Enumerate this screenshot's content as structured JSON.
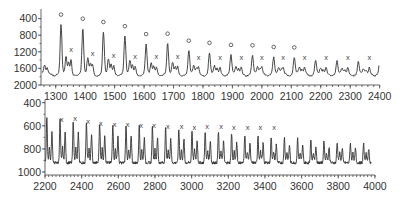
{
  "chart_data": [
    {
      "type": "line",
      "title": "",
      "xlabel": "",
      "ylabel": "",
      "xlim": [
        1250,
        2400
      ],
      "ylim": [
        400,
        2100
      ],
      "grid": false,
      "legend": null,
      "x_ticks": [
        1300,
        1400,
        1500,
        1600,
        1700,
        1800,
        1900,
        2000,
        2100,
        2200,
        2300,
        2400
      ],
      "y_ticks": [
        400,
        800,
        1200,
        1600,
        2000
      ],
      "description": "Oscillating series with a major peak roughly every 72 units (marked 'o') and a secondary peak (marked 'x') between them; major peak heights decline from ~1900 to ~1100.",
      "series": [
        {
          "name": "signal",
          "major_peaks_o": [
            {
              "x": 1318,
              "y": 1880
            },
            {
              "x": 1392,
              "y": 1780
            },
            {
              "x": 1462,
              "y": 1700
            },
            {
              "x": 1535,
              "y": 1600
            },
            {
              "x": 1607,
              "y": 1410
            },
            {
              "x": 1680,
              "y": 1420
            },
            {
              "x": 1752,
              "y": 1250
            },
            {
              "x": 1822,
              "y": 1200
            },
            {
              "x": 1895,
              "y": 1150
            },
            {
              "x": 1968,
              "y": 1140
            },
            {
              "x": 2040,
              "y": 1100
            },
            {
              "x": 2110,
              "y": 1090
            }
          ],
          "secondary_peaks_x": [
            {
              "x": 1352,
              "y": 1050
            },
            {
              "x": 1425,
              "y": 950
            },
            {
              "x": 1497,
              "y": 900
            },
            {
              "x": 1570,
              "y": 880
            },
            {
              "x": 1642,
              "y": 880
            },
            {
              "x": 1714,
              "y": 880
            },
            {
              "x": 1785,
              "y": 870
            },
            {
              "x": 1858,
              "y": 870
            },
            {
              "x": 1930,
              "y": 860
            },
            {
              "x": 2000,
              "y": 860
            },
            {
              "x": 2072,
              "y": 860
            },
            {
              "x": 2145,
              "y": 860
            },
            {
              "x": 2218,
              "y": 850
            },
            {
              "x": 2292,
              "y": 850
            },
            {
              "x": 2365,
              "y": 850
            }
          ],
          "baseline": 700
        }
      ]
    },
    {
      "type": "line",
      "title": "",
      "xlabel": "",
      "ylabel": "",
      "xlim": [
        2200,
        4000
      ],
      "ylim": [
        380,
        1000
      ],
      "grid": false,
      "legend": null,
      "x_ticks": [
        2200,
        2400,
        2600,
        2800,
        3000,
        3200,
        3400,
        3600,
        3800,
        4000
      ],
      "y_ticks": [
        400,
        600,
        800,
        1000
      ],
      "description": "Continuation of the oscillating series with period ~72 units; peaks decline from ~900 to ~650; secondary peaks marked 'x' up to ~3450.",
      "series": [
        {
          "name": "signal",
          "secondary_peaks_x": [
            {
              "x": 2290,
              "y": 780
            },
            {
              "x": 2365,
              "y": 790
            },
            {
              "x": 2435,
              "y": 760
            },
            {
              "x": 2505,
              "y": 750
            },
            {
              "x": 2580,
              "y": 740
            },
            {
              "x": 2650,
              "y": 735
            },
            {
              "x": 2725,
              "y": 730
            },
            {
              "x": 2795,
              "y": 730
            },
            {
              "x": 2870,
              "y": 725
            },
            {
              "x": 2945,
              "y": 725
            },
            {
              "x": 3015,
              "y": 715
            },
            {
              "x": 3085,
              "y": 720
            },
            {
              "x": 3160,
              "y": 720
            },
            {
              "x": 3230,
              "y": 715
            },
            {
              "x": 3305,
              "y": 710
            },
            {
              "x": 3375,
              "y": 710
            },
            {
              "x": 3450,
              "y": 710
            }
          ],
          "peak_range": [
            650,
            920
          ],
          "trough_range": [
            440,
            520
          ]
        }
      ]
    }
  ],
  "panels": {
    "top": {
      "y_tick_labels": [
        "2000",
        "1600",
        "1200",
        "800",
        "400"
      ],
      "x_tick_labels": [
        "1300",
        "1400",
        "1500",
        "1600",
        "1700",
        "1800",
        "1900",
        "2000",
        "2100",
        "2200",
        "2300",
        "2400"
      ],
      "marker_o": "o",
      "marker_x": "x"
    },
    "bottom": {
      "y_tick_labels": [
        "1000",
        "800",
        "600",
        "400"
      ],
      "x_tick_labels": [
        "2200",
        "2400",
        "2600",
        "2800",
        "3000",
        "3200",
        "3400",
        "3600",
        "3800",
        "4000"
      ],
      "marker_x": "x"
    }
  }
}
